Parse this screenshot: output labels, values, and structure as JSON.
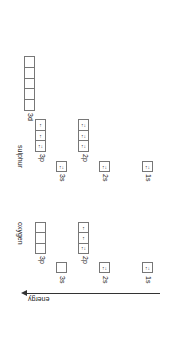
{
  "diagram": {
    "axis": {
      "label": "energy",
      "direction": "increasing-left (rotated view)"
    },
    "elements": [
      {
        "name": "sulphur",
        "orbitals": [
          {
            "label": "1s",
            "boxes": 1,
            "electrons": [
              "↑↓"
            ]
          },
          {
            "label": "2s",
            "boxes": 1,
            "electrons": [
              "↑↓"
            ]
          },
          {
            "label": "2p",
            "boxes": 3,
            "electrons": [
              "↑↓",
              "↑↓",
              "↑↓"
            ]
          },
          {
            "label": "3s",
            "boxes": 1,
            "electrons": [
              "↑↓"
            ]
          },
          {
            "label": "3p",
            "boxes": 3,
            "electrons": [
              "↑↓",
              "↑",
              "↑"
            ]
          },
          {
            "label": "3d",
            "boxes": 5,
            "electrons": [
              "",
              "",
              "",
              "",
              ""
            ]
          }
        ]
      },
      {
        "name": "oxygen",
        "orbitals": [
          {
            "label": "1s",
            "boxes": 1,
            "electrons": [
              "↑↓"
            ]
          },
          {
            "label": "2s",
            "boxes": 1,
            "electrons": [
              "↑↓"
            ]
          },
          {
            "label": "2p",
            "boxes": 3,
            "electrons": [
              "↑↓",
              "↑",
              "↑"
            ]
          },
          {
            "label": "3s",
            "boxes": 1,
            "electrons": [
              ""
            ]
          },
          {
            "label": "3p",
            "boxes": 3,
            "electrons": [
              "",
              "",
              ""
            ]
          }
        ]
      }
    ]
  },
  "labels": {
    "sulphur": "sulphur",
    "oxygen": "oxygen",
    "energy": "energy",
    "s3d": "3d",
    "s3p": "3p",
    "s3s": "3s",
    "s2p": "2p",
    "s2s": "2s",
    "s1s": "1s",
    "o3p": "3p",
    "o3s": "3s",
    "o2p": "2p",
    "o2s": "2s",
    "o1s": "1s"
  },
  "electrons": {
    "pair": "↑↓",
    "single": "↑"
  }
}
